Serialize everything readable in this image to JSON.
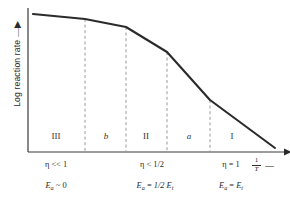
{
  "figure": {
    "kind": "line-diagram",
    "background_color": "#ffffff",
    "curve_color": "#2b2b2b",
    "axis_color": "#3a3a3a",
    "divider_color": "#9a9a9a"
  },
  "axes": {
    "y_label": "Log reaction rate",
    "y_label_arrow": "▲",
    "x_label_numerator": "1",
    "x_label_denominator": "T",
    "x_label_arrow": "▶"
  },
  "regions": [
    {
      "label": "III",
      "italic": false,
      "x_center_pct": 18.5
    },
    {
      "label": "b",
      "italic": true,
      "x_center_pct": 36.5
    },
    {
      "label": "II",
      "italic": false,
      "x_center_pct": 55.5
    },
    {
      "label": "a",
      "italic": true,
      "x_center_pct": 72.5
    },
    {
      "label": "I",
      "italic": false,
      "x_center_pct": 88.0
    }
  ],
  "annotations": [
    {
      "eta_symbol": "η",
      "eta_relation": "<< 1",
      "ea_symbol": "E",
      "ea_subscript": "a",
      "ea_relation": "~",
      "ea_value": "0",
      "x_center_pct": 18.5
    },
    {
      "eta_symbol": "η",
      "eta_relation": "< 1/2",
      "ea_symbol": "E",
      "ea_subscript": "a",
      "ea_relation": "=",
      "ea_value": "1/2 E",
      "ea_value_subscript": "t",
      "x_center_pct": 55.5
    },
    {
      "eta_symbol": "η",
      "eta_relation": "= 1",
      "ea_symbol": "E",
      "ea_subscript": "a",
      "ea_relation": "=",
      "ea_value": "E",
      "ea_value_subscript": "t",
      "x_center_pct": 88.0
    }
  ],
  "chart_data": {
    "type": "line",
    "title": "",
    "xlabel": "1/T",
    "ylabel": "Log reaction rate",
    "xlim": [
      0,
      1
    ],
    "ylim": [
      0,
      1
    ],
    "grid": false,
    "legend": "none",
    "series": [
      {
        "name": "log reaction rate",
        "comment": "Arrhenius plot with diffusion-limited regimes; piecewise slopes steepen left-to-right",
        "points_px": [
          {
            "x": 33,
            "y": 14
          },
          {
            "x": 85,
            "y": 19
          },
          {
            "x": 126,
            "y": 27
          },
          {
            "x": 167,
            "y": 52
          },
          {
            "x": 210,
            "y": 100
          },
          {
            "x": 275,
            "y": 148
          }
        ]
      }
    ],
    "dividers_px": [
      85,
      126,
      167,
      210
    ],
    "divider_tops_px": [
      19,
      27,
      52,
      100
    ],
    "axis_origin_px": {
      "x": 28,
      "y": 152
    },
    "axis_x_end_px": 284,
    "axis_y_top_px": 8,
    "region_boundaries_px": [
      28,
      85,
      126,
      167,
      210,
      275
    ]
  }
}
